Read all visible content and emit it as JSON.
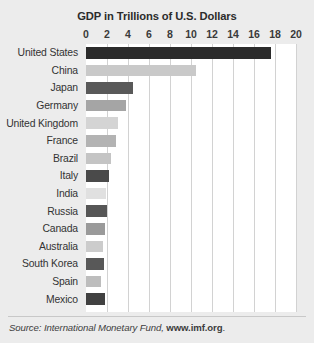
{
  "chart_data": {
    "type": "bar",
    "orientation": "horizontal",
    "title": "GDP in Trillions of U.S. Dollars",
    "xlabel": "",
    "ylabel": "",
    "xlim": [
      0,
      20
    ],
    "xticks": [
      0,
      2,
      4,
      6,
      8,
      10,
      12,
      14,
      16,
      18,
      20
    ],
    "xtick_labels": [
      "0",
      "2",
      "4",
      "6",
      "8",
      "10",
      "12",
      "14",
      "16",
      "18",
      "20"
    ],
    "grid": true,
    "grid_axis": "x",
    "legend": false,
    "categories": [
      "United States",
      "China",
      "Japan",
      "Germany",
      "United Kingdom",
      "France",
      "Brazil",
      "Italy",
      "India",
      "Russia",
      "Canada",
      "Australia",
      "South Korea",
      "Spain",
      "Mexico"
    ],
    "values": [
      17.6,
      10.5,
      4.5,
      3.8,
      3.0,
      2.9,
      2.4,
      2.2,
      1.9,
      2.0,
      1.8,
      1.6,
      1.7,
      1.4,
      1.8
    ],
    "bar_colors": [
      "#2b2b2b",
      "#c9c9c9",
      "#595959",
      "#a5a5a5",
      "#d4d4d4",
      "#b3b3b3",
      "#c4c4c4",
      "#4a4a4a",
      "#e0e0e0",
      "#565656",
      "#9a9a9a",
      "#cccccc",
      "#585858",
      "#bdbdbd",
      "#414141"
    ]
  },
  "footer": {
    "source_label": "Source: International Monetary Fund, ",
    "source_url": "www.imf.org",
    "trailing": "."
  },
  "colors": {
    "background": "#ececec",
    "plot_background": "#ffffff",
    "gridline": "#d2d2d2",
    "text": "#333333",
    "title_text": "#2b2b2b"
  }
}
